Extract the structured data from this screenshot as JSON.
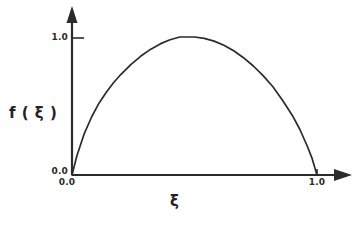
{
  "figure": {
    "background_color": "#ffffff",
    "line_color": "#2b2b2b"
  },
  "chart_data": {
    "type": "line",
    "title": "",
    "xlabel": "ξ",
    "ylabel": "f ( ξ )",
    "xlim": [
      0.0,
      1.0
    ],
    "ylim": [
      0.0,
      1.0
    ],
    "grid": false,
    "legend": null,
    "x_tick_labels": [
      "0.0",
      "1.0"
    ],
    "y_tick_labels": [
      "0.0",
      "1.0"
    ],
    "x_ticks": [
      0.0,
      1.0
    ],
    "y_ticks": [
      0.0,
      1.0
    ],
    "series": [
      {
        "name": "f(ξ)",
        "description": "Arch-shaped curve rising from 0 at ξ=0 to a maximum of 1.0 near ξ=0.47 and falling steeply back to 0 at ξ=1.0",
        "x": [
          0.0,
          0.02,
          0.05,
          0.08,
          0.11,
          0.14,
          0.17,
          0.2,
          0.24,
          0.28,
          0.32,
          0.36,
          0.4,
          0.44,
          0.47,
          0.5,
          0.54,
          0.58,
          0.62,
          0.66,
          0.7,
          0.74,
          0.78,
          0.82,
          0.86,
          0.9,
          0.93,
          0.96,
          0.98,
          1.0
        ],
        "y": [
          0.0,
          0.14,
          0.3,
          0.42,
          0.52,
          0.6,
          0.67,
          0.73,
          0.8,
          0.86,
          0.91,
          0.95,
          0.98,
          1.0,
          1.0,
          1.0,
          0.99,
          0.97,
          0.94,
          0.9,
          0.85,
          0.79,
          0.72,
          0.64,
          0.54,
          0.43,
          0.33,
          0.21,
          0.12,
          0.0
        ]
      }
    ]
  },
  "axes": {
    "y_axis_arrow": "arrow-up-icon",
    "x_axis_arrow": "arrow-right-icon",
    "origin_label_y": "0.0",
    "origin_label_x": "0.0",
    "top_label_y": "1.0",
    "right_label_x": "1.0",
    "axis_title_y": "f ( ξ )",
    "axis_title_x": "ξ"
  }
}
